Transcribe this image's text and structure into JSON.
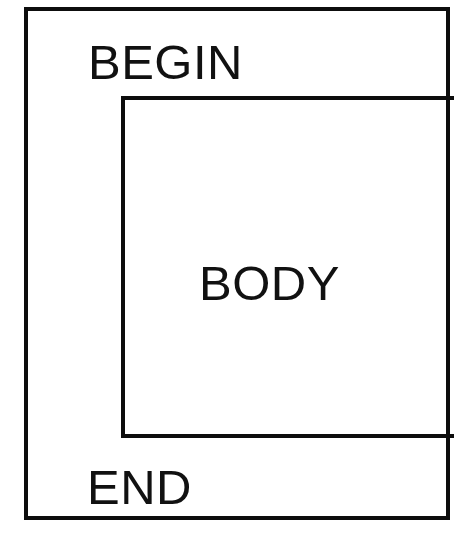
{
  "diagram": {
    "type": "nested-block-structure",
    "title": "",
    "colors": {
      "stroke": "#0d0d0d",
      "background": "#ffffff",
      "text": "#111111"
    },
    "outer_block": {
      "label": "BEGIN",
      "end_label": "END"
    },
    "inner_block": {
      "label": "BODY"
    },
    "labels": {
      "begin": "BEGIN",
      "body": "BODY",
      "end": "END"
    }
  }
}
